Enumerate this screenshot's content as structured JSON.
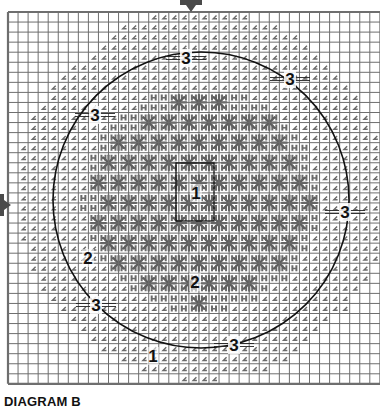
{
  "caption": "DIAGRAM B",
  "colors": {
    "grid": "#6e6e6e",
    "stitch": "#6a6a6a",
    "star": "#5e5e5e",
    "outline": "#111111",
    "background": "#ffffff"
  },
  "grid": {
    "left": 8,
    "top": 12,
    "cell": 10.05,
    "cols": 37,
    "rows": 37
  },
  "circle": {
    "cx": 201,
    "cy": 200,
    "r": 148
  },
  "center_box": {
    "x": 176,
    "y": 163,
    "w": 38,
    "h": 58
  },
  "arrows": [
    {
      "name": "top-center-arrow",
      "x": 191,
      "y": 12,
      "dir": "down"
    },
    {
      "name": "left-center-arrow",
      "x": 8,
      "y": 205,
      "dir": "right"
    }
  ],
  "labels": [
    {
      "text": "3",
      "x": 186,
      "y": 58
    },
    {
      "text": "3",
      "x": 290,
      "y": 79
    },
    {
      "text": "3",
      "x": 95,
      "y": 115
    },
    {
      "text": "3",
      "x": 345,
      "y": 212
    },
    {
      "text": "3",
      "x": 96,
      "y": 305
    },
    {
      "text": "3",
      "x": 234,
      "y": 345
    },
    {
      "text": "2",
      "x": 88,
      "y": 258
    },
    {
      "text": "2",
      "x": 195,
      "y": 282
    },
    {
      "text": "1",
      "x": 196,
      "y": 193
    },
    {
      "text": "1",
      "x": 153,
      "y": 356
    }
  ],
  "regions": [
    {
      "id": "1",
      "description": "outer stitch zone (half-stitch hooks)"
    },
    {
      "id": "2",
      "description": "inner star motif zone"
    },
    {
      "id": "3",
      "description": "circle boundary marks"
    }
  ]
}
